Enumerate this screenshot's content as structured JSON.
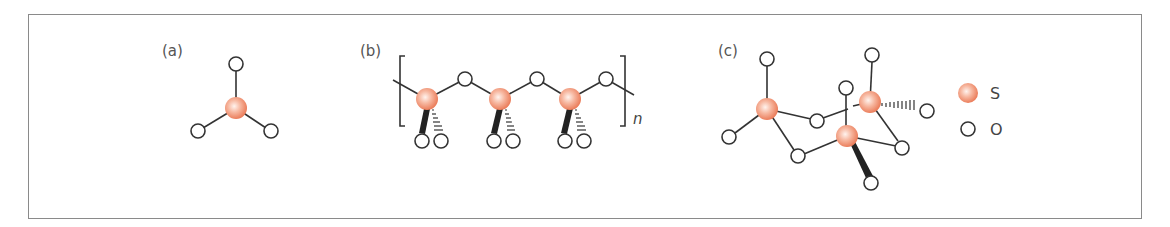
{
  "panels": [
    {
      "id": "a",
      "label": "(a)"
    },
    {
      "id": "b",
      "label": "(b)",
      "subscript": "n"
    },
    {
      "id": "c",
      "label": "(c)"
    }
  ],
  "legend": [
    {
      "symbol": "S",
      "label": "S",
      "fill": "#f08a6a"
    },
    {
      "symbol": "O",
      "label": "O",
      "fill": "#ffffff"
    }
  ],
  "colors": {
    "sulfur": "#f08a6a",
    "sulfur_highlight": "#fde8e0",
    "oxygen_stroke": "#333333",
    "bond": "#333333",
    "frame": "#8a8a8a"
  }
}
